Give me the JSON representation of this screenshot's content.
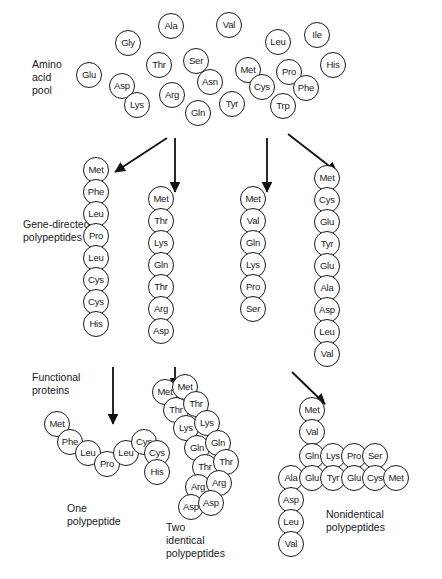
{
  "figure": {
    "circle_diameter_px": 26,
    "stroke_color": "#1a1a1a",
    "background": "#ffffff"
  },
  "labels": {
    "amino_acid_pool": "Amino\nacid\npool",
    "gene_directed": "Gene-directed\npolypeptides",
    "functional_proteins": "Functional\nproteins",
    "one_polypeptide": "One\npolypeptide",
    "two_identical": "Two\nidentical\npolypeptides",
    "nonidentical": "Nonidentical\npolypeptides"
  },
  "pool": [
    {
      "name": "Gly",
      "x": 128,
      "y": 43
    },
    {
      "name": "Ala",
      "x": 171,
      "y": 26
    },
    {
      "name": "Val",
      "x": 229,
      "y": 25
    },
    {
      "name": "Leu",
      "x": 278,
      "y": 42
    },
    {
      "name": "Ile",
      "x": 317,
      "y": 35
    },
    {
      "name": "Glu",
      "x": 89,
      "y": 75
    },
    {
      "name": "Asp",
      "x": 122,
      "y": 86
    },
    {
      "name": "Thr",
      "x": 159,
      "y": 65
    },
    {
      "name": "Ser",
      "x": 196,
      "y": 61
    },
    {
      "name": "Met",
      "x": 248,
      "y": 70
    },
    {
      "name": "Pro",
      "x": 289,
      "y": 72
    },
    {
      "name": "His",
      "x": 333,
      "y": 65
    },
    {
      "name": "Lys",
      "x": 137,
      "y": 105
    },
    {
      "name": "Arg",
      "x": 172,
      "y": 95
    },
    {
      "name": "Asn",
      "x": 210,
      "y": 82
    },
    {
      "name": "Cys",
      "x": 262,
      "y": 87
    },
    {
      "name": "Phe",
      "x": 306,
      "y": 88
    },
    {
      "name": "Gln",
      "x": 198,
      "y": 113
    },
    {
      "name": "Tyr",
      "x": 232,
      "y": 104
    },
    {
      "name": "Trp",
      "x": 283,
      "y": 106
    }
  ],
  "gene_directed_chains": [
    {
      "id": "chain-1",
      "x": 96,
      "y_start": 170,
      "residues": [
        "Met",
        "Phe",
        "Leu",
        "Pro",
        "Leu",
        "Cys",
        "Cys",
        "His"
      ]
    },
    {
      "id": "chain-2",
      "x": 161,
      "y_start": 199,
      "residues": [
        "Met",
        "Thr",
        "Lys",
        "Gln",
        "Thr",
        "Arg",
        "Asp"
      ]
    },
    {
      "id": "chain-3",
      "x": 253,
      "y_start": 199,
      "residues": [
        "Met",
        "Val",
        "Gln",
        "Lys",
        "Pro",
        "Ser"
      ]
    },
    {
      "id": "chain-4",
      "x": 327,
      "y_start": 178,
      "residues": [
        "Met",
        "Cys",
        "Glu",
        "Tyr",
        "Glu",
        "Ala",
        "Asp",
        "Leu",
        "Val"
      ]
    }
  ],
  "functional_proteins": {
    "one_polypeptide": {
      "id": "protein-one",
      "residues": [
        {
          "name": "Met",
          "x": 57,
          "y": 424
        },
        {
          "name": "Phe",
          "x": 70,
          "y": 442
        },
        {
          "name": "Leu",
          "x": 88,
          "y": 453
        },
        {
          "name": "Pro",
          "x": 107,
          "y": 464
        },
        {
          "name": "Leu",
          "x": 126,
          "y": 453
        },
        {
          "name": "Cys",
          "x": 144,
          "y": 442
        },
        {
          "name": "Cys",
          "x": 157,
          "y": 453
        },
        {
          "name": "His",
          "x": 157,
          "y": 472
        }
      ]
    },
    "two_identical": {
      "id": "protein-two-identical",
      "residues": [
        {
          "name": "Met",
          "x": 165,
          "y": 392
        },
        {
          "name": "Thr",
          "x": 176,
          "y": 410
        },
        {
          "name": "Lys",
          "x": 186,
          "y": 428
        },
        {
          "name": "Gln",
          "x": 197,
          "y": 448
        },
        {
          "name": "Thr",
          "x": 205,
          "y": 467
        },
        {
          "name": "Arg",
          "x": 198,
          "y": 487
        },
        {
          "name": "Asp",
          "x": 191,
          "y": 507
        },
        {
          "name": "Met",
          "x": 185,
          "y": 387
        },
        {
          "name": "Thr",
          "x": 196,
          "y": 404
        },
        {
          "name": "Lys",
          "x": 207,
          "y": 423
        },
        {
          "name": "Gln",
          "x": 218,
          "y": 443
        },
        {
          "name": "Thr",
          "x": 226,
          "y": 462
        },
        {
          "name": "Arg",
          "x": 219,
          "y": 483
        },
        {
          "name": "Asp",
          "x": 211,
          "y": 503
        }
      ]
    },
    "nonidentical": {
      "id": "protein-nonidentical",
      "residues": [
        {
          "name": "Met",
          "x": 312,
          "y": 410
        },
        {
          "name": "Val",
          "x": 312,
          "y": 432
        },
        {
          "name": "Gln",
          "x": 312,
          "y": 456
        },
        {
          "name": "Lys",
          "x": 333,
          "y": 456
        },
        {
          "name": "Pro",
          "x": 354,
          "y": 456
        },
        {
          "name": "Ser",
          "x": 375,
          "y": 456
        },
        {
          "name": "Ala",
          "x": 291,
          "y": 478
        },
        {
          "name": "Glu",
          "x": 312,
          "y": 478
        },
        {
          "name": "Tyr",
          "x": 333,
          "y": 478
        },
        {
          "name": "Glu",
          "x": 354,
          "y": 478
        },
        {
          "name": "Cys",
          "x": 375,
          "y": 478
        },
        {
          "name": "Met",
          "x": 396,
          "y": 478
        },
        {
          "name": "Asp",
          "x": 291,
          "y": 500
        },
        {
          "name": "Leu",
          "x": 291,
          "y": 522
        },
        {
          "name": "Val",
          "x": 291,
          "y": 544
        }
      ]
    }
  },
  "arrows": [
    {
      "id": "arrow-pool-to-chain1",
      "x1": 167,
      "y1": 138,
      "x2": 115,
      "y2": 172
    },
    {
      "id": "arrow-pool-to-chain2",
      "x1": 175,
      "y1": 138,
      "x2": 175,
      "y2": 192
    },
    {
      "id": "arrow-pool-to-chain3",
      "x1": 267,
      "y1": 138,
      "x2": 267,
      "y2": 192
    },
    {
      "id": "arrow-pool-to-chain4",
      "x1": 288,
      "y1": 134,
      "x2": 337,
      "y2": 172
    },
    {
      "id": "arrow-chain1-to-protein",
      "x1": 113,
      "y1": 367,
      "x2": 113,
      "y2": 424
    },
    {
      "id": "arrow-chain2-to-protein",
      "x1": 175,
      "y1": 367,
      "x2": 175,
      "y2": 388
    },
    {
      "id": "arrow-chain4-to-protein",
      "x1": 292,
      "y1": 372,
      "x2": 325,
      "y2": 404
    }
  ]
}
